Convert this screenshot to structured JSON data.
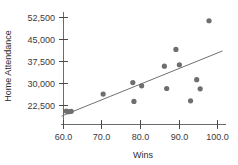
{
  "chart_data": {
    "type": "scatter",
    "title": "",
    "xlabel": "Wins",
    "ylabel": "Home Attendance",
    "xlim": [
      58.0,
      102.0
    ],
    "ylim": [
      18500,
      54500
    ],
    "grid": false,
    "legend": null,
    "xticks": [
      60.0,
      70.0,
      80.0,
      90.0,
      100.0
    ],
    "xticklabels": [
      "60.0",
      "70.0",
      "80.0",
      "90.0",
      "100.0"
    ],
    "yticks": [
      22500,
      30000,
      37500,
      45000,
      52500
    ],
    "yticklabels": [
      "22,500",
      "30,000",
      "37,500",
      "45,000",
      "52,500"
    ],
    "points": [
      {
        "x": 60.7,
        "y": 20600
      },
      {
        "x": 61.3,
        "y": 20400
      },
      {
        "x": 62.0,
        "y": 20500
      },
      {
        "x": 70.3,
        "y": 26400
      },
      {
        "x": 78.0,
        "y": 30300
      },
      {
        "x": 78.3,
        "y": 23900
      },
      {
        "x": 80.3,
        "y": 29200
      },
      {
        "x": 86.2,
        "y": 35900
      },
      {
        "x": 86.8,
        "y": 28300
      },
      {
        "x": 89.2,
        "y": 41600
      },
      {
        "x": 90.1,
        "y": 36400
      },
      {
        "x": 93.0,
        "y": 24100
      },
      {
        "x": 94.6,
        "y": 31300
      },
      {
        "x": 95.5,
        "y": 28200
      },
      {
        "x": 97.8,
        "y": 51400
      }
    ],
    "trendline": {
      "label": "least-squares fit",
      "x_start": 59.5,
      "y_start": 18900,
      "x_end": 101.3,
      "y_end": 41100
    },
    "colors": {
      "point": "#6e6e6e",
      "line": "#707070",
      "axis": "#6b6b6b",
      "text": "#3a3a3a"
    }
  }
}
